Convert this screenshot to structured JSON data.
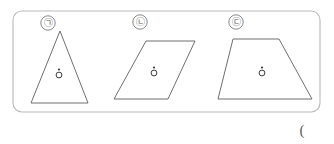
{
  "figure": {
    "panel": {
      "name": "figure-panel",
      "border_color": "#b9b9b9",
      "fill_color": "#ffffff",
      "x": 13,
      "y": 11,
      "width": 307,
      "height": 101,
      "corner_radius": 9
    },
    "stroke_color": "#6f6f6f",
    "label_circle_color": "#7a7a7a",
    "marker_color": "#3c3c3c",
    "items": [
      {
        "label": "㉠",
        "shape": "triangle",
        "label_x": 48,
        "label_y": 23,
        "points": "60,31 88,103 31,103",
        "marker_x": 59,
        "marker_y": 75
      },
      {
        "label": "㉡",
        "shape": "parallelogram",
        "label_x": 140,
        "label_y": 22,
        "points": "146,41 195,41 168,99 114,99",
        "marker_x": 154,
        "marker_y": 73
      },
      {
        "label": "㉢",
        "shape": "trapezoid",
        "label_x": 236,
        "label_y": 22,
        "points": "233,39 279,39 312,99 218,99",
        "marker_x": 262,
        "marker_y": 73
      }
    ],
    "trailing_paren": {
      "text": "(",
      "x": 302,
      "y": 130
    }
  }
}
